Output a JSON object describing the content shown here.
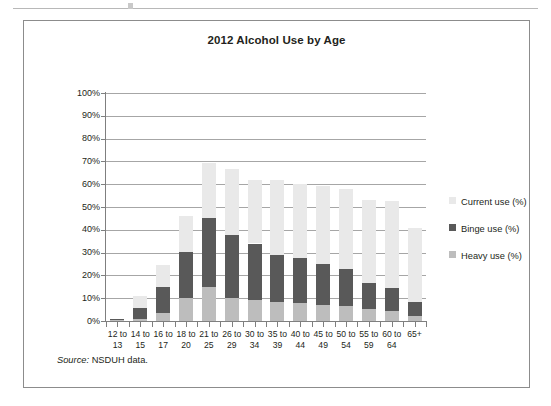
{
  "figure": {
    "source_label": "Source:",
    "source_text": "NSDUH data."
  },
  "legend": {
    "position": "right",
    "items": [
      {
        "label": "Current use (%)",
        "color": "#e9e9e9",
        "key": "current"
      },
      {
        "label": "Binge use (%)",
        "color": "#595959",
        "key": "binge"
      },
      {
        "label": "Heavy use (%)",
        "color": "#bdbdbd",
        "key": "heavy"
      }
    ]
  },
  "chart_data": {
    "type": "bar",
    "stacked": true,
    "title": "2012 Alcohol Use by Age",
    "xlabel": "",
    "ylabel": "",
    "ylim": [
      0,
      100
    ],
    "ytick_labels": [
      "100%",
      "90%",
      "80%",
      "70%",
      "60%",
      "50%",
      "40%",
      "30%",
      "20%",
      "10%",
      "0%"
    ],
    "ytick_values": [
      100,
      90,
      80,
      70,
      60,
      50,
      40,
      30,
      20,
      10,
      0
    ],
    "grid": "horizontal",
    "categories": [
      "12 to 13",
      "14 to 15",
      "16 to 17",
      "18 to 20",
      "21 to 25",
      "26 to 29",
      "30 to 34",
      "35 to 39",
      "40 to 44",
      "45 to 49",
      "50 to 54",
      "55 to 59",
      "60 to 64",
      "65+"
    ],
    "category_lines": [
      [
        "12 to",
        "13"
      ],
      [
        "14 to",
        "15"
      ],
      [
        "16 to",
        "17"
      ],
      [
        "18 to",
        "20"
      ],
      [
        "21 to",
        "25"
      ],
      [
        "26 to",
        "29"
      ],
      [
        "30 to",
        "34"
      ],
      [
        "35 to",
        "39"
      ],
      [
        "40 to",
        "44"
      ],
      [
        "45 to",
        "49"
      ],
      [
        "50 to",
        "54"
      ],
      [
        "55 to",
        "59"
      ],
      [
        "60 to",
        "64"
      ],
      [
        "65+",
        ""
      ]
    ],
    "series": [
      {
        "name": "Heavy use (%)",
        "color": "#bdbdbd",
        "values": [
          0.3,
          1.1,
          3.3,
          10.3,
          14.8,
          10.2,
          9.2,
          8.5,
          8.1,
          7.0,
          6.6,
          5.1,
          4.2,
          2.0
        ]
      },
      {
        "name": "Binge use (%)",
        "color": "#595959",
        "values": [
          0.7,
          4.5,
          11.7,
          20.0,
          30.2,
          27.5,
          24.8,
          20.5,
          19.4,
          18.0,
          16.2,
          11.7,
          10.2,
          6.5
        ]
      },
      {
        "name": "Current use (%)",
        "color": "#e9e9e9",
        "values": [
          0.0,
          5.4,
          9.5,
          15.7,
          24.5,
          28.8,
          28.0,
          32.8,
          32.8,
          34.0,
          35.2,
          36.2,
          38.1,
          32.5
        ]
      }
    ],
    "totals": [
      1.0,
      11.0,
      24.5,
      46.0,
      69.5,
      66.5,
      62.0,
      61.8,
      60.3,
      59.0,
      58.0,
      53.0,
      52.5,
      41.0
    ]
  }
}
